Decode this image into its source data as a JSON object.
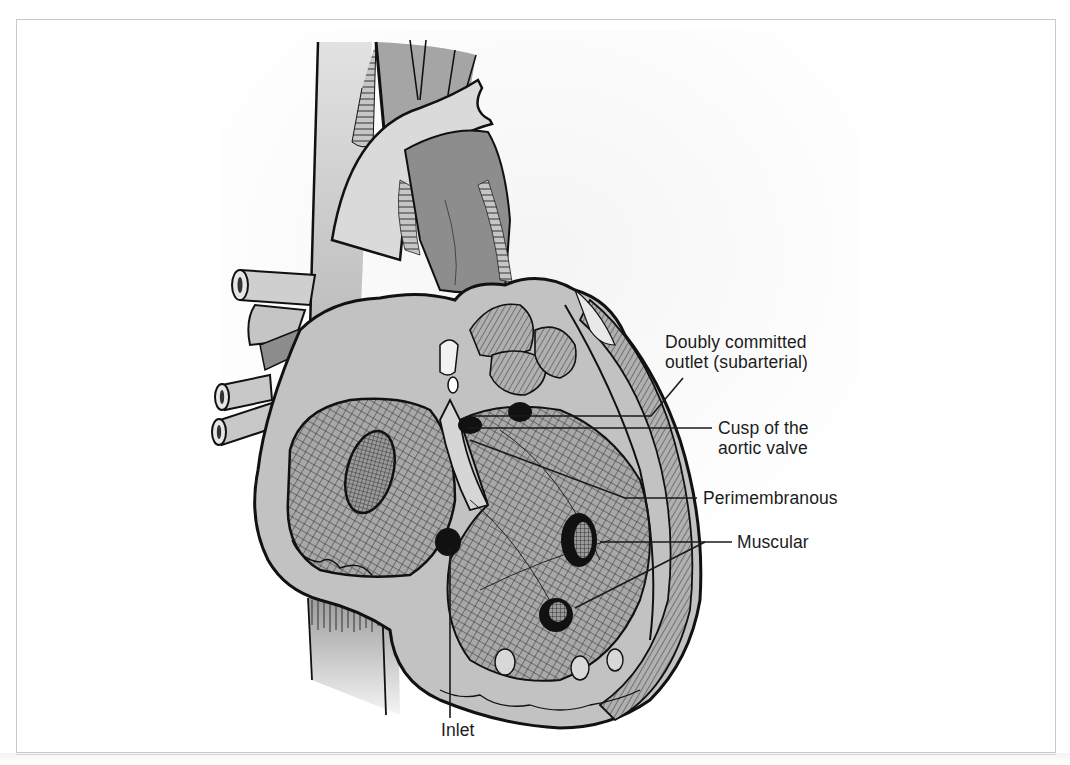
{
  "figure": {
    "labels": {
      "doubly_committed_line1": "Doubly committed",
      "doubly_committed_line2": "outlet (subarterial)",
      "cusp_line1": "Cusp of the",
      "cusp_line2": "aortic valve",
      "perimembranous": "Perimembranous",
      "muscular": "Muscular",
      "inlet": "Inlet"
    }
  },
  "colors": {
    "ink": "#1c1c1c",
    "frame_border": "#c9c9c9",
    "tissue_light": "#c8c8c8",
    "tissue_mid": "#a9a9a9",
    "tissue_dark": "#8a8a8a",
    "paper": "#ffffff"
  }
}
